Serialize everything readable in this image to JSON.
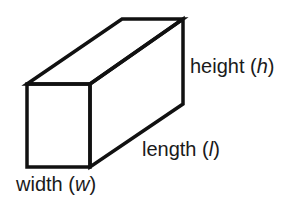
{
  "diagram": {
    "type": "rectangular-prism",
    "line_color": "#111111",
    "labels": {
      "height": {
        "word": "height",
        "var": "h"
      },
      "length": {
        "word": "length",
        "var": "l"
      },
      "width": {
        "word": "width",
        "var": "w"
      }
    }
  }
}
